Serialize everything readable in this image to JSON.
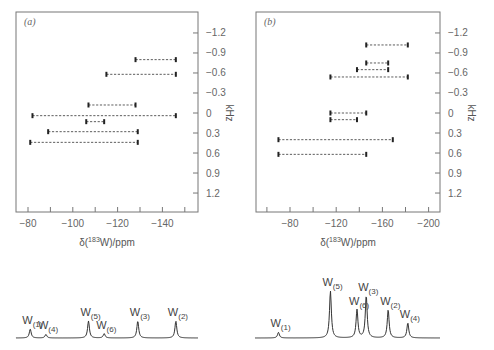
{
  "chart_data": [
    {
      "type": "scatter",
      "panel_label": "(a)",
      "xlabel": "δ(183W)/ppm",
      "xlabel_parts": {
        "delta": "δ(",
        "sup": "183",
        "rest": "W)/ppm"
      },
      "ylabel": "kHz",
      "xlim": [
        -75,
        -156
      ],
      "ylim": [
        -1.5,
        1.5
      ],
      "x_ticks": [
        -80,
        -90,
        -100,
        -110,
        -120,
        -130,
        -140,
        -150
      ],
      "x_tick_labels": [
        "-80",
        "-100",
        "-120",
        "-140"
      ],
      "x_tick_label_values": [
        -80,
        -100,
        -120,
        -140
      ],
      "y_ticks": [
        -1.2,
        -0.9,
        -0.6,
        -0.3,
        0,
        0.3,
        0.6,
        0.9,
        1.2
      ],
      "y_tick_labels": [
        "-1.2",
        "-0.9",
        "-0.6",
        "-0.3",
        "0",
        "0.3",
        "0.6",
        "0.9",
        "1.2"
      ],
      "correlations": [
        {
          "y": -0.8,
          "x1": -128,
          "x2": -146
        },
        {
          "y": -0.58,
          "x1": -115,
          "x2": -146
        },
        {
          "y": -0.12,
          "x1": -107,
          "x2": -128
        },
        {
          "y": 0.04,
          "x1": -82,
          "x2": -146
        },
        {
          "y": 0.13,
          "x1": -106,
          "x2": -114
        },
        {
          "y": 0.28,
          "x1": -89,
          "x2": -129
        },
        {
          "y": 0.44,
          "x1": -81,
          "x2": -129
        }
      ],
      "spectrum": {
        "peaks": [
          {
            "label": "W",
            "sub": "(1)",
            "x": -81,
            "height": 0.45
          },
          {
            "label": "W",
            "sub": "(4)",
            "x": -88,
            "height": 0.18
          },
          {
            "label": "W",
            "sub": "(5)",
            "x": -107,
            "height": 0.85
          },
          {
            "label": "W",
            "sub": "(6)",
            "x": -114,
            "height": 0.22
          },
          {
            "label": "W",
            "sub": "(3)",
            "x": -129,
            "height": 0.85
          },
          {
            "label": "W",
            "sub": "(2)",
            "x": -146,
            "height": 0.85
          }
        ]
      }
    },
    {
      "type": "scatter",
      "panel_label": "(b)",
      "xlabel": "δ(183W)/ppm",
      "xlabel_parts": {
        "delta": "δ(",
        "sup": "183",
        "rest": "W)/ppm"
      },
      "ylabel": "kHz",
      "xlim": [
        -50,
        -212
      ],
      "ylim": [
        -1.5,
        1.5
      ],
      "x_ticks": [
        -60,
        -80,
        -100,
        -120,
        -140,
        -160,
        -180,
        -200
      ],
      "x_tick_labels": [
        "-80",
        "-120",
        "-160",
        "-200"
      ],
      "x_tick_label_values": [
        -80,
        -120,
        -160,
        -200
      ],
      "y_ticks": [
        -1.2,
        -0.9,
        -0.6,
        -0.3,
        0,
        0.3,
        0.6,
        0.9,
        1.2
      ],
      "y_tick_labels": [
        "-1.2",
        "-0.9",
        "-0.6",
        "-0.3",
        "0",
        "0.3",
        "0.6",
        "0.9",
        "1.2"
      ],
      "correlations": [
        {
          "y": -1.02,
          "x1": -146,
          "x2": -182
        },
        {
          "y": -0.75,
          "x1": -146,
          "x2": -165
        },
        {
          "y": -0.65,
          "x1": -138,
          "x2": -165
        },
        {
          "y": -0.54,
          "x1": -115,
          "x2": -182
        },
        {
          "y": 0.0,
          "x1": -115,
          "x2": -146
        },
        {
          "y": 0.1,
          "x1": -115,
          "x2": -138
        },
        {
          "y": 0.4,
          "x1": -70,
          "x2": -169
        },
        {
          "y": 0.62,
          "x1": -70,
          "x2": -146
        }
      ],
      "spectrum": {
        "peaks": [
          {
            "label": "W",
            "sub": "(1)",
            "x": -70,
            "height": 0.12
          },
          {
            "label": "W",
            "sub": "(5)",
            "x": -115,
            "height": 1.0
          },
          {
            "label": "W",
            "sub": "(6)",
            "x": -138,
            "height": 0.6
          },
          {
            "label": "W",
            "sub": "(3)",
            "x": -146,
            "height": 0.9
          },
          {
            "label": "W",
            "sub": "(2)",
            "x": -165,
            "height": 0.6
          },
          {
            "label": "W",
            "sub": "(4)",
            "x": -182,
            "height": 0.32
          }
        ]
      }
    }
  ]
}
